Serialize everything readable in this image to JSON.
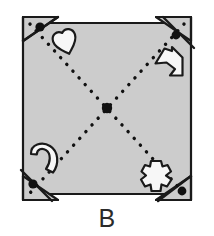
{
  "figure": {
    "label": "B",
    "kind": "rotational-symmetry-puzzle-square",
    "colors": {
      "panel_fill": "#cccccc",
      "outline": "#1a1a1a",
      "shape_fill": "#f7f7f7",
      "dot": "#111111",
      "background": "#ffffff",
      "label_color": "#2b2b2b"
    },
    "panel": {
      "name": "square-panel",
      "x": 23,
      "y": 17,
      "width": 168,
      "height": 183,
      "stroke_width": 2.2
    },
    "center_dot": {
      "name": "center-pivot-dot",
      "cx": 107,
      "cy": 108,
      "r": 5.2
    },
    "diagonals": [
      {
        "name": "diagonal-top-left-to-bottom-right",
        "x1": 30,
        "y1": 24,
        "x2": 184,
        "y2": 193,
        "style": "dotted"
      },
      {
        "name": "diagonal-top-right-to-bottom-left",
        "x1": 184,
        "y1": 24,
        "x2": 30,
        "y2": 193,
        "style": "dotted"
      }
    ],
    "corners": [
      {
        "name": "corner-top-left",
        "position": "top-left",
        "dot": {
          "cx": 40,
          "cy": 27,
          "r": 4.6
        }
      },
      {
        "name": "corner-top-right",
        "position": "top-right",
        "dot": {
          "cx": 175,
          "cy": 34,
          "r": 4.4
        }
      },
      {
        "name": "corner-bottom-left",
        "position": "bottom-left",
        "dot": {
          "cx": 32,
          "cy": 185,
          "r": 4.6
        }
      },
      {
        "name": "corner-bottom-right",
        "position": "bottom-right",
        "dot": {
          "cx": 182,
          "cy": 192,
          "r": 4.4
        }
      }
    ],
    "shapes": [
      {
        "name": "heart-shape",
        "quadrant": "top-left",
        "cx": 65,
        "cy": 41,
        "rotation": -18,
        "scale": 1.0
      },
      {
        "name": "arrow-shape",
        "quadrant": "top-right",
        "cx": 169,
        "cy": 63,
        "rotation": 0,
        "scale": 1.0
      },
      {
        "name": "crescent-hook-shape",
        "quadrant": "bottom-left",
        "cx": 44,
        "cy": 158,
        "rotation": 0,
        "scale": 1.0
      },
      {
        "name": "jagged-cross-shape",
        "quadrant": "bottom-right",
        "cx": 156,
        "cy": 176,
        "rotation": 0,
        "scale": 1.0
      }
    ]
  }
}
